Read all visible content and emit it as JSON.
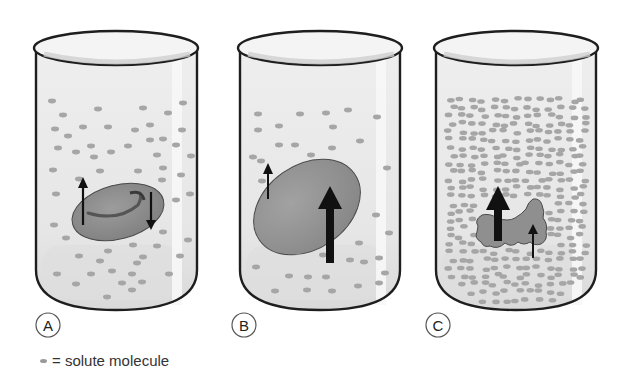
{
  "diagram": {
    "colors": {
      "background": "#ffffff",
      "beaker_outline": "#1e1e1e",
      "liquid": "#e9e9e9",
      "liquid_bottom": "#dcdcdc",
      "highlight": "#f6f6f6",
      "solute": "#a8a8a8",
      "cell_fill": "#8c8c8c",
      "cell_outline": "#4a4a4a",
      "arrow": "#111111"
    },
    "beakers": [
      {
        "id": "A",
        "label": "A",
        "solute_density": "medium",
        "cell_state": "normal biconcave disc",
        "arrows": [
          {
            "direction": "up",
            "size": "thin",
            "meaning": "water out"
          },
          {
            "direction": "down",
            "size": "thin",
            "meaning": "water in"
          }
        ]
      },
      {
        "id": "B",
        "label": "B",
        "solute_density": "low",
        "cell_state": "swollen",
        "arrows": [
          {
            "direction": "up",
            "size": "thin"
          },
          {
            "direction": "up",
            "size": "thick"
          }
        ]
      },
      {
        "id": "C",
        "label": "C",
        "solute_density": "high",
        "cell_state": "shrunken / crenated",
        "arrows": [
          {
            "direction": "up",
            "size": "thick"
          },
          {
            "direction": "up",
            "size": "thin"
          }
        ]
      }
    ]
  },
  "legend": {
    "symbol": "solute-dot",
    "text": "= solute molecule"
  }
}
